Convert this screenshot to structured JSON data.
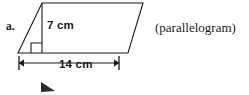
{
  "figure": {
    "item_letter": "a.",
    "shape_name": "(parallelogram)",
    "shape_kind": "parallelogram",
    "labels": {
      "height": "7 cm",
      "base": "14 cm"
    },
    "measurements": {
      "height_value": 7,
      "height_unit": "cm",
      "base_value": 14,
      "base_unit": "cm"
    },
    "colors": {
      "stroke": "#1a1a1a",
      "text": "#1a1a1a",
      "background": "#ffffff"
    },
    "geometry": {
      "outline_points": "42,3 143,3 128,53 18,53",
      "height_line": {
        "x1": 42,
        "y1": 3,
        "x2": 42,
        "y2": 53
      },
      "right_angle_marker": "31,53 31,43 42,43",
      "dimension_line": {
        "x1": 19,
        "y1": 63,
        "x2": 119,
        "y2": 63
      },
      "dim_tick_left": {
        "x": 19,
        "y1": 56,
        "y2": 70
      },
      "dim_tick_right": {
        "x": 119,
        "y1": 56,
        "y2": 70
      },
      "arrow_left": "24,59.5 24,66.5 18.5,63",
      "arrow_right": "114,59.5 114,66.5 119.5,63",
      "stray_mark": "41,82 41,92 55,91"
    }
  }
}
